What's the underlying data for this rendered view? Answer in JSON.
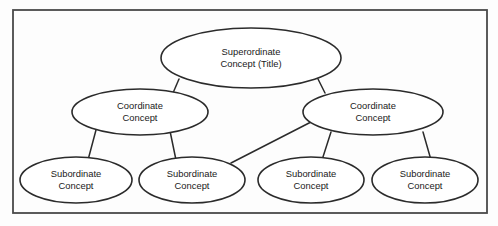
{
  "diagram": {
    "frame": {
      "x": 13,
      "y": 10,
      "width": 474,
      "height": 203,
      "stroke_color": "#4a4a4a",
      "background_color": "#fdfdfd"
    },
    "node_style": {
      "fill_color": "#ffffff",
      "stroke_color": "#2b2b2b",
      "text_color": "#1a1a1a"
    },
    "levels": [
      {
        "level": 1,
        "name": "superordinate",
        "nodes": [
          {
            "id": "superordinate-concept",
            "line1": "Superordinate",
            "line2": "Concept (Title)",
            "cx": 251,
            "cy": 58,
            "rx": 90,
            "ry": 30
          }
        ]
      },
      {
        "level": 2,
        "name": "coordinate",
        "nodes": [
          {
            "id": "coordinate-concept-left",
            "line1": "Coordinate",
            "line2": "Concept",
            "cx": 140,
            "cy": 112,
            "rx": 68,
            "ry": 23
          },
          {
            "id": "coordinate-concept-right",
            "line1": "Coordinate",
            "line2": "Concept",
            "cx": 373,
            "cy": 112,
            "rx": 70,
            "ry": 23
          }
        ]
      },
      {
        "level": 3,
        "name": "subordinate",
        "nodes": [
          {
            "id": "subordinate-concept-1",
            "line1": "Subordinate",
            "line2": "Concept",
            "cx": 76,
            "cy": 180,
            "rx": 56,
            "ry": 23
          },
          {
            "id": "subordinate-concept-2",
            "line1": "Subordinate",
            "line2": "Concept",
            "cx": 192,
            "cy": 180,
            "rx": 53,
            "ry": 23
          },
          {
            "id": "subordinate-concept-3",
            "line1": "Subordinate",
            "line2": "Concept",
            "cx": 311,
            "cy": 180,
            "rx": 53,
            "ry": 23
          },
          {
            "id": "subordinate-concept-4",
            "line1": "Subordinate",
            "line2": "Concept",
            "cx": 425,
            "cy": 180,
            "rx": 53,
            "ry": 23
          }
        ]
      }
    ],
    "connectors": [
      {
        "id": "link-super-to-coord-left",
        "from": "superordinate-concept",
        "to": "coordinate-concept-left",
        "x1": 179,
        "y1": 79,
        "x2": 173,
        "y2": 93
      },
      {
        "id": "link-super-to-coord-right",
        "from": "superordinate-concept",
        "to": "coordinate-concept-right",
        "x1": 318,
        "y1": 79,
        "x2": 325,
        "y2": 93
      },
      {
        "id": "link-coord-left-to-sub-1",
        "from": "coordinate-concept-left",
        "to": "subordinate-concept-1",
        "x1": 96,
        "y1": 130,
        "x2": 88,
        "y2": 160
      },
      {
        "id": "link-coord-left-to-sub-2",
        "from": "coordinate-concept-left",
        "to": "subordinate-concept-2",
        "x1": 170,
        "y1": 131,
        "x2": 176,
        "y2": 160
      },
      {
        "id": "link-coord-right-to-sub-2",
        "from": "coordinate-concept-right",
        "to": "subordinate-concept-2",
        "x1": 311,
        "y1": 122,
        "x2": 231,
        "y2": 163
      },
      {
        "id": "link-coord-right-to-sub-3",
        "from": "coordinate-concept-right",
        "to": "subordinate-concept-3",
        "x1": 331,
        "y1": 132,
        "x2": 322,
        "y2": 160
      },
      {
        "id": "link-coord-right-to-sub-4",
        "from": "coordinate-concept-right",
        "to": "subordinate-concept-4",
        "x1": 423,
        "y1": 132,
        "x2": 431,
        "y2": 160
      }
    ]
  },
  "chart_data": {
    "type": "diagram",
    "structure": "tree",
    "nodes": [
      {
        "id": "superordinate-concept",
        "label": "Superordinate Concept (Title)",
        "level": 1
      },
      {
        "id": "coordinate-concept-left",
        "label": "Coordinate Concept",
        "level": 2
      },
      {
        "id": "coordinate-concept-right",
        "label": "Coordinate Concept",
        "level": 2
      },
      {
        "id": "subordinate-concept-1",
        "label": "Subordinate Concept",
        "level": 3
      },
      {
        "id": "subordinate-concept-2",
        "label": "Subordinate Concept",
        "level": 3
      },
      {
        "id": "subordinate-concept-3",
        "label": "Subordinate Concept",
        "level": 3
      },
      {
        "id": "subordinate-concept-4",
        "label": "Subordinate Concept",
        "level": 3
      }
    ],
    "edges": [
      [
        "superordinate-concept",
        "coordinate-concept-left"
      ],
      [
        "superordinate-concept",
        "coordinate-concept-right"
      ],
      [
        "coordinate-concept-left",
        "subordinate-concept-1"
      ],
      [
        "coordinate-concept-left",
        "subordinate-concept-2"
      ],
      [
        "coordinate-concept-right",
        "subordinate-concept-2"
      ],
      [
        "coordinate-concept-right",
        "subordinate-concept-3"
      ],
      [
        "coordinate-concept-right",
        "subordinate-concept-4"
      ]
    ]
  }
}
